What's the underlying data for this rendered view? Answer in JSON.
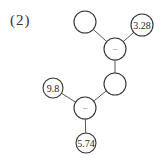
{
  "problem_label": "(2)",
  "diagram": {
    "type": "operation-tree",
    "nodes": [
      {
        "id": "blank_top",
        "text": "",
        "kind": "blank"
      },
      {
        "id": "n_3_28",
        "text": "3.28",
        "kind": "number"
      },
      {
        "id": "op_top",
        "text": "−",
        "kind": "operator"
      },
      {
        "id": "blank_mid",
        "text": "",
        "kind": "blank"
      },
      {
        "id": "n_9_8",
        "text": "9.8",
        "kind": "number"
      },
      {
        "id": "op_bottom",
        "text": "−",
        "kind": "operator"
      },
      {
        "id": "n_5_74",
        "text": "5.74",
        "kind": "number"
      }
    ],
    "edges": [
      [
        "blank_top",
        "op_top"
      ],
      [
        "n_3_28",
        "op_top"
      ],
      [
        "op_top",
        "blank_mid"
      ],
      [
        "blank_mid",
        "op_bottom"
      ],
      [
        "n_9_8",
        "op_bottom"
      ],
      [
        "op_bottom",
        "n_5_74"
      ]
    ]
  }
}
